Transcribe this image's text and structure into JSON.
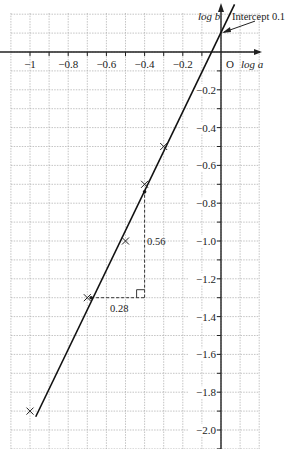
{
  "chart_data": {
    "type": "scatter",
    "title": "",
    "xlabel": "log a",
    "ylabel": "log b",
    "origin_label": "O",
    "xlim": [
      -1.1,
      0.2
    ],
    "ylim": [
      -2.1,
      0.2
    ],
    "grid": true,
    "x_ticks": [
      -1,
      -0.8,
      -0.6,
      -0.4,
      -0.2
    ],
    "x_tick_labels": [
      "−1",
      "−0.8",
      "−0.6",
      "−0.4",
      "−0.2"
    ],
    "y_ticks": [
      -0.2,
      -0.4,
      -0.6,
      -0.8,
      -1.0,
      -1.2,
      -1.4,
      -1.6,
      -1.8,
      -2.0
    ],
    "y_tick_labels": [
      "−0.2",
      "−0.4",
      "−0.6",
      "−0.8",
      "−1.0",
      "−1.2",
      "−1.4",
      "−1.6",
      "−1.8",
      "−2.0"
    ],
    "series": [
      {
        "name": "data points",
        "marker": "x",
        "x": [
          -1.0,
          -0.7,
          -0.5,
          -0.4,
          -0.3
        ],
        "y": [
          -1.9,
          -1.3,
          -1.0,
          -0.7,
          -0.5
        ]
      }
    ],
    "line_of_best_fit": {
      "slope": 2,
      "intercept": 0.1,
      "from": [
        -0.97,
        -1.93
      ],
      "to": [
        0.05,
        0.21
      ]
    },
    "annotations": [
      {
        "text": "Intercept 0.1",
        "target": [
          0,
          0.1
        ],
        "type": "arrow-label"
      },
      {
        "text": "0.28",
        "type": "gradient-triangle-run",
        "from": [
          -0.68,
          -1.3
        ],
        "to": [
          -0.4,
          -1.3
        ]
      },
      {
        "text": "0.56",
        "type": "gradient-triangle-rise",
        "from": [
          -0.4,
          -1.3
        ],
        "to": [
          -0.4,
          -0.74
        ]
      }
    ]
  },
  "labels": {
    "x_axis": "log a",
    "y_axis": "log b",
    "origin": "O",
    "intercept": "Intercept 0.1",
    "run": "0.28",
    "rise": "0.56"
  }
}
